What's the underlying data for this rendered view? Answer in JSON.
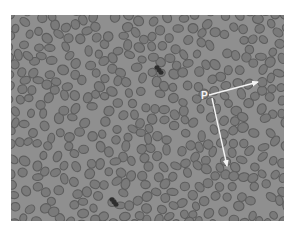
{
  "figure": {
    "type": "blood smear micrograph",
    "background_color": "#ffffff",
    "micrograph_bg_color": "#8f8f8f",
    "cell_fill_color": "#7a7a7a",
    "cell_rim_color": "#5e5e5e",
    "leukocyte_color": "#2e2e2e",
    "annotation_color": "#f4f4f4",
    "label": "P",
    "label_position": {
      "x": 201,
      "y": 91
    },
    "arrows": [
      {
        "from": {
          "x": 209,
          "y": 95
        },
        "to": {
          "x": 258,
          "y": 82
        }
      },
      {
        "from": {
          "x": 212,
          "y": 98
        },
        "to": {
          "x": 227,
          "y": 166
        }
      }
    ],
    "dark_cells": [
      {
        "x": 159,
        "y": 70
      },
      {
        "x": 114,
        "y": 202
      }
    ]
  }
}
